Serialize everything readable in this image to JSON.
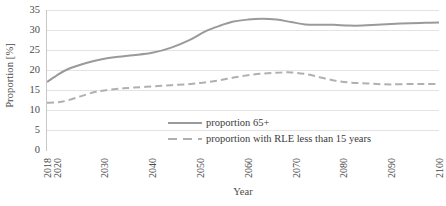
{
  "chart_data": {
    "type": "line",
    "title": "",
    "xlabel": "Year",
    "ylabel": "Proportion [%]",
    "ylim": [
      0,
      35
    ],
    "xlim": [
      2018,
      2100
    ],
    "yticks": [
      0,
      5,
      10,
      15,
      20,
      25,
      30,
      35
    ],
    "xticks": [
      2018,
      2020,
      2030,
      2040,
      2050,
      2060,
      2070,
      2080,
      2090,
      2100
    ],
    "xtick_labels": [
      "2018",
      "2020",
      "2030",
      "2040",
      "2050",
      "2060",
      "2070",
      "2080",
      "2090",
      "2100"
    ],
    "grid": "horizontal",
    "legend_position": "lower center",
    "series": [
      {
        "name": "proportion 65+",
        "style": "solid",
        "color": "#9a9a9a",
        "x": [
          2018,
          2020,
          2022,
          2025,
          2028,
          2030,
          2033,
          2036,
          2040,
          2044,
          2048,
          2051,
          2054,
          2057,
          2060,
          2063,
          2066,
          2069,
          2072,
          2075,
          2078,
          2081,
          2084,
          2087,
          2090,
          2094,
          2097,
          2100
        ],
        "y": [
          17.0,
          18.6,
          20.0,
          21.3,
          22.3,
          22.8,
          23.3,
          23.7,
          24.3,
          25.6,
          27.6,
          29.6,
          31.0,
          32.1,
          32.6,
          32.8,
          32.6,
          32.0,
          31.4,
          31.3,
          31.3,
          31.1,
          31.1,
          31.3,
          31.5,
          31.7,
          31.8,
          31.9
        ]
      },
      {
        "name": "proportion with RLE less than 15 years",
        "style": "dashed",
        "color": "#b0b0b0",
        "x": [
          2018,
          2020,
          2022,
          2025,
          2028,
          2030,
          2033,
          2036,
          2040,
          2044,
          2048,
          2051,
          2054,
          2057,
          2060,
          2063,
          2066,
          2069,
          2072,
          2075,
          2078,
          2081,
          2084,
          2087,
          2090,
          2094,
          2097,
          2100
        ],
        "y": [
          11.8,
          11.9,
          12.3,
          13.4,
          14.5,
          14.9,
          15.3,
          15.6,
          15.9,
          16.2,
          16.5,
          16.9,
          17.4,
          18.1,
          18.7,
          19.1,
          19.3,
          19.4,
          19.0,
          18.2,
          17.4,
          16.9,
          16.7,
          16.5,
          16.4,
          16.5,
          16.5,
          16.5
        ]
      }
    ]
  },
  "legend": {
    "items": [
      {
        "label": "proportion 65+",
        "style": "solid"
      },
      {
        "label": "proportion with RLE less than 15 years",
        "style": "dashed"
      }
    ]
  },
  "axes": {
    "y_title": "Proportion [%]",
    "x_title": "Year"
  },
  "colors": {
    "series_solid": "#9a9a9a",
    "series_dashed": "#b0b0b0",
    "gridline": "#e3e3e3",
    "axis": "#c8c8c8",
    "text": "#4a4a4a",
    "background": "#ffffff"
  }
}
